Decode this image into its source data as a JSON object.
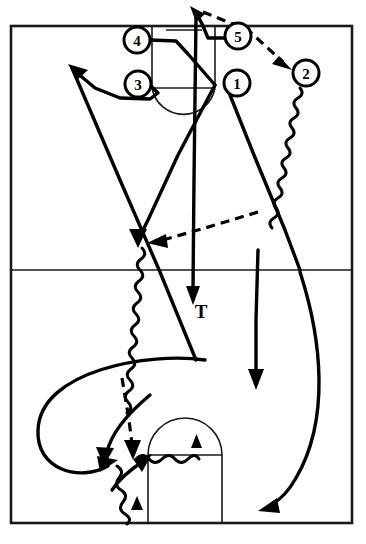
{
  "diagram": {
    "court": {
      "border": {
        "x": 11,
        "y": 26,
        "width": 341,
        "height": 497
      },
      "division_line_y": 270,
      "top_key": {
        "left_x": 152,
        "right_x": 215,
        "baseline_y": 26,
        "freethrow_y": 88,
        "circle_radius": 31
      },
      "bottom_key": {
        "left_x": 148,
        "right_x": 222,
        "baseline_y": 523,
        "freethrow_y": 455,
        "circle_radius": 37
      }
    },
    "players": [
      {
        "id": "player-4",
        "label": "4",
        "x": 137,
        "y": 40,
        "radius": 13
      },
      {
        "id": "player-5",
        "label": "5",
        "x": 238,
        "y": 36,
        "radius": 13
      },
      {
        "id": "player-3",
        "label": "3",
        "x": 138,
        "y": 84,
        "radius": 13
      },
      {
        "id": "player-1",
        "label": "1",
        "x": 237,
        "y": 83,
        "radius": 13
      },
      {
        "id": "player-2",
        "label": "2",
        "x": 306,
        "y": 73,
        "radius": 13
      }
    ],
    "annotations": [
      {
        "id": "label-t",
        "text": "T",
        "x": 199,
        "y": 311
      }
    ],
    "legend": {
      "solid_line": "cut / player movement",
      "wavy_line": "dribble",
      "dashed_line": "pass",
      "filled_triangle": "screen"
    },
    "colors": {
      "court_stroke": "#1a1a1a",
      "path_stroke": "#000000",
      "background": "#ffffff"
    },
    "path_count": {
      "cuts": 8,
      "dribbles": 4,
      "passes": 3,
      "screens": 2
    }
  }
}
